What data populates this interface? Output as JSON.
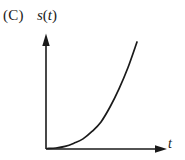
{
  "figure": {
    "choice_label": "(C)",
    "y_axis_label": "s(t)",
    "y_axis_label_parts": {
      "func": "s",
      "open_paren": "(",
      "var": "t",
      "close_paren": ")"
    },
    "x_axis_label": "t",
    "stroke_color": "#1a1a1a",
    "background_color": "#ffffff"
  },
  "chart_data": {
    "type": "line",
    "title": "(C)",
    "xlabel": "t",
    "ylabel": "s(t)",
    "grid": false,
    "legend": null,
    "axis_style": "arrowed-axes",
    "xlim": [
      0,
      1
    ],
    "ylim": [
      0,
      1
    ],
    "series": [
      {
        "name": "s(t)",
        "x": [
          0.0,
          0.1,
          0.2,
          0.3,
          0.4,
          0.5,
          0.6,
          0.7,
          0.8,
          0.9,
          1.0
        ],
        "y": [
          0.0,
          0.005,
          0.02,
          0.05,
          0.09,
          0.16,
          0.25,
          0.39,
          0.56,
          0.76,
          1.0
        ]
      }
    ]
  }
}
